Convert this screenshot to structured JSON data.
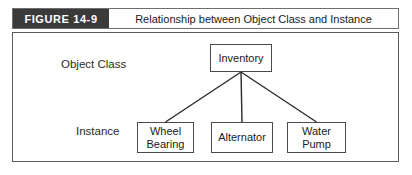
{
  "figure": {
    "tag": "FIGURE 14-9",
    "title": "Relationship between Object Class and Instance"
  },
  "diagram": {
    "type": "class-instance-tree",
    "row_labels": {
      "top": "Object Class",
      "bottom": "Instance"
    },
    "root": {
      "label": "Inventory"
    },
    "instances": [
      {
        "line1": "Wheel",
        "line2": "Bearing"
      },
      {
        "line1": "Alternator",
        "line2": ""
      },
      {
        "line1": "Water",
        "line2": "Pump"
      }
    ]
  },
  "colors": {
    "tag_background": "#3a3a3a",
    "tag_text": "#ffffff",
    "frame_border": "#5a5a5a",
    "box_border": "#4a4a4a",
    "connector": "#2a2a2a",
    "page_background": "#ffffff",
    "text": "#1a1a1a"
  }
}
